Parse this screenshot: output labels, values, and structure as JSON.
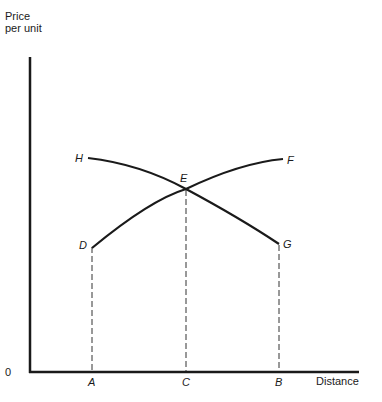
{
  "diagram": {
    "y_axis_label": "Price per unit",
    "x_axis_label": "Distance",
    "origin_label": "0",
    "curves": [
      {
        "id": "DF",
        "start_label": "D",
        "end_label": "F",
        "description": "rising curve from D to F"
      },
      {
        "id": "HG",
        "start_label": "H",
        "end_label": "G",
        "description": "falling curve from H to G"
      }
    ],
    "intersection_label": "E",
    "x_points": [
      {
        "label": "A",
        "note": "below D"
      },
      {
        "label": "C",
        "note": "below E"
      },
      {
        "label": "B",
        "note": "below G"
      }
    ],
    "colors": {
      "line": "#1a1a1a",
      "background": "#ffffff"
    }
  }
}
